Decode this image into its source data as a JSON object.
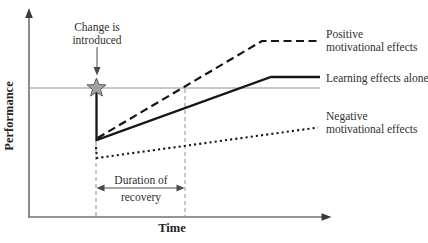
{
  "labels": {
    "y_axis": "Performance",
    "x_axis": "Time",
    "change_line1": "Change is",
    "change_line2": "introduced",
    "duration_line1": "Duration of",
    "duration_line2": "recovery",
    "positive_line1": "Positive",
    "positive_line2": "motivational effects",
    "learning": "Learning effects alone",
    "negative_line1": "Negative",
    "negative_line2": "motivational effects"
  },
  "colors": {
    "ink": "#161616",
    "text": "#2f2f2f",
    "axis": "#707070",
    "guide": "#909090",
    "baseline": "#8f8f8f",
    "star_fill": "#a3a3a3",
    "star_stroke": "#5c5c5c"
  },
  "chart_data": {
    "type": "line",
    "title": "",
    "xlabel": "Time",
    "ylabel": "Performance",
    "axes_numeric": false,
    "legend_position": "right, inline with line ends",
    "baseline_meaning": "thin horizontal line = pre-change performance level",
    "annotations": [
      "Change is introduced (arrow pointing to star marker on baseline)",
      "Duration of recovery (double-headed arrow between two dashed vertical guides)"
    ],
    "series": [
      {
        "name": "Positive motivational effects",
        "style": "dashed",
        "shape": "starts at post-change dip, rises steeply, reaches baseline at end of recovery window, plateaus well above baseline"
      },
      {
        "name": "Learning effects alone",
        "style": "solid",
        "shape": "vertical drop from baseline star at change point, rises steadily, plateaus slightly above baseline"
      },
      {
        "name": "Negative motivational effects",
        "style": "dotted",
        "shape": "starts below the others, rises only slightly, stays below baseline throughout"
      }
    ]
  },
  "geometry": {
    "y_axis": "29,217 29,14",
    "y_axis_head": "29,8 25.2,18 32.8,18",
    "x_axis": "28,217 324,217",
    "x_axis_head": "331.5,217 321.5,213.2 321.5,220.8",
    "baseline": "29,88 320,88",
    "solid_series": "96.5,90 96.5,140 271,77 320,77",
    "dashed_series": "97.5,138 262,41 320,41",
    "dotted_series": "96,147 96.8,158 318,127.5",
    "guide_left": "96,142 96,216",
    "guide_right": "185,89 185,216",
    "duration_arrow": "102,188 179,188",
    "duration_head_left": "96.5,188 104.5,184.6 104.5,191.4",
    "duration_head_right": "184.5,188 176.5,184.6 176.5,191.4",
    "change_arrow": "97,47 97,69",
    "change_arrow_head": "97,75.5 93.5,67 100.5,67",
    "star": "96.5,78 99,84.6 106,84.9 100.5,89.3 102.4,96.1 96.5,92.2 90.6,96.1 92.5,89.3 87,84.9 94,84.6"
  }
}
